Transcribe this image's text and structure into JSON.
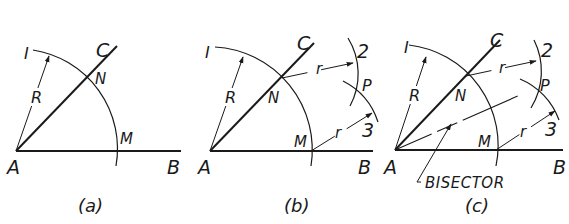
{
  "figure": {
    "colors": {
      "ink": "#1a1a1a",
      "background": "#ffffff"
    },
    "panels": [
      {
        "caption": "(a)",
        "labels": {
          "A": "A",
          "B": "B",
          "C": "C",
          "N": "N",
          "M": "M",
          "R": "R",
          "arc": "I"
        }
      },
      {
        "caption": "(b)",
        "labels": {
          "A": "A",
          "B": "B",
          "C": "C",
          "N": "N",
          "M": "M",
          "R": "R",
          "arc1": "I",
          "arc2": "2",
          "arc3": "3",
          "P": "P",
          "r_top": "r",
          "r_bottom": "r"
        }
      },
      {
        "caption": "(c)",
        "labels": {
          "A": "A",
          "B": "B",
          "C": "C",
          "N": "N",
          "M": "M",
          "R": "R",
          "arc1": "I",
          "arc2": "2",
          "arc3": "3",
          "P": "P",
          "r_top": "r",
          "r_bottom": "r",
          "bisector": "BISECTOR"
        }
      }
    ]
  }
}
